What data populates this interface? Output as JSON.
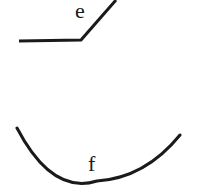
{
  "diagram": {
    "stroke_color": "#1a1a1a",
    "background": "#ffffff",
    "shapes": [
      {
        "id": "bent-line-e",
        "type": "polyline",
        "label": "e",
        "points": [
          [
            19,
            41
          ],
          [
            81,
            40
          ],
          [
            116,
            0
          ]
        ]
      },
      {
        "id": "arc-f",
        "type": "arc",
        "label": "f",
        "start": [
          17,
          128
        ],
        "bottom": [
          97,
          182
        ],
        "end": [
          180,
          135
        ]
      }
    ],
    "labels": {
      "e": "e",
      "f": "f"
    }
  }
}
